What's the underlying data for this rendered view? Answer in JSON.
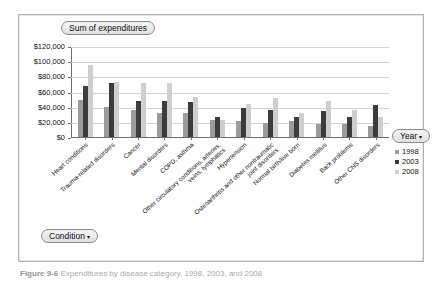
{
  "title_field": {
    "label": "Sum of expenditures",
    "caret": "▾"
  },
  "legend": {
    "field_label": "Year",
    "caret": "▾",
    "entries": [
      {
        "label": "1998",
        "color": "#9b9b9b"
      },
      {
        "label": "2003",
        "color": "#3c3c3c"
      },
      {
        "label": "2008",
        "color": "#cfcfcf"
      }
    ]
  },
  "condition_field": {
    "label": "Condition",
    "caret": "▾"
  },
  "caption": {
    "figure": "Figure 9-6",
    "text": "Expenditures by disease category, 1998, 2003, and 2008"
  },
  "chart_data": {
    "type": "bar",
    "title": "Sum of expenditures",
    "xlabel": "",
    "ylabel": "",
    "ylim": [
      0,
      120000
    ],
    "ytick_labels": [
      "$120,000",
      "$100,000",
      "$80,000",
      "$60,000",
      "$40,000",
      "$20,000",
      "$0"
    ],
    "ytick_values": [
      120000,
      100000,
      80000,
      60000,
      40000,
      20000,
      0
    ],
    "grid": true,
    "legend_position": "right",
    "categories": [
      "Heart conditions",
      "Trauma-related disorders",
      "Cancer",
      "Mental disorders",
      "COPD, asthma",
      "Other circulatory conditions, arteries, veins, lymphatics",
      "Hypertension",
      "Osteoarthritis and other nontraumatic joint disorders",
      "Normal birth/live born",
      "Diabetes mellitus",
      "Back problems",
      "Other CNS disorders"
    ],
    "category_lines": [
      [
        "Heart conditions"
      ],
      [
        "Trauma-related disorders"
      ],
      [
        "Cancer"
      ],
      [
        "Mental disorders"
      ],
      [
        "COPD, asthma"
      ],
      [
        "Other circulatory conditions, arteries,",
        "veins, lymphatics"
      ],
      [
        "Hypertension"
      ],
      [
        "Osteoarthritis and other nontraumatic",
        "joint disorders"
      ],
      [
        "Normal birth/live born"
      ],
      [
        "Diabetes mellitus"
      ],
      [
        "Back problems"
      ],
      [
        "Other CNS disorders"
      ]
    ],
    "series": [
      {
        "name": "1998",
        "color": "#9b9b9b",
        "values": [
          49000,
          40000,
          35000,
          32000,
          32000,
          22000,
          21000,
          19000,
          21000,
          17000,
          17000,
          14000
        ]
      },
      {
        "name": "2003",
        "color": "#3c3c3c",
        "values": [
          67000,
          71000,
          48000,
          47000,
          46000,
          26000,
          38000,
          36000,
          26000,
          34000,
          27000,
          42000
        ]
      },
      {
        "name": "2008",
        "color": "#cfcfcf",
        "values": [
          95000,
          73000,
          71000,
          71000,
          53000,
          22000,
          44000,
          51000,
          32000,
          48000,
          36000,
          26000
        ]
      }
    ]
  }
}
